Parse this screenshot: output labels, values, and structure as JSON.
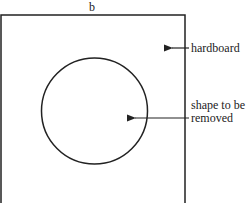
{
  "diagram": {
    "dimension_label": "b",
    "labels": {
      "board": "hardboard",
      "cutout_line1": "shape to be",
      "cutout_line2": "removed"
    },
    "shapes": {
      "board": {
        "type": "rectangle",
        "edges_visible": [
          "top",
          "left",
          "right"
        ]
      },
      "cutout": {
        "type": "circle"
      }
    },
    "colors": {
      "stroke": "#222222",
      "background": "#ffffff"
    }
  }
}
